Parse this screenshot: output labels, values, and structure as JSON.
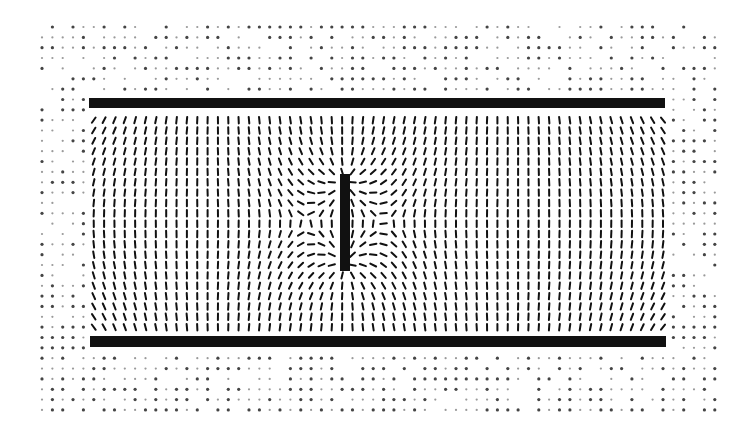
{
  "diagram": {
    "title": "",
    "background": "#ffffff",
    "ink_color": "#111111",
    "grid": {
      "x0": 42,
      "y0": 27,
      "dx": 10.35,
      "dy": 10.35,
      "cols": 66,
      "rows": 38,
      "segment_length": 6.5,
      "segment_width": 2.0
    },
    "top_plate": {
      "x": 89,
      "y": 98,
      "width": 576,
      "height": 10
    },
    "bottom_plate": {
      "x": 90,
      "y": 336,
      "width": 576,
      "height": 11
    },
    "center_bar": {
      "x": 340,
      "y": 174,
      "width": 10,
      "height": 97
    },
    "outer_region": {
      "description": "Faint, sparse dots outside the plates (weak field)",
      "faint_color": "#9a9a9a",
      "dot_size": 1.6
    }
  }
}
